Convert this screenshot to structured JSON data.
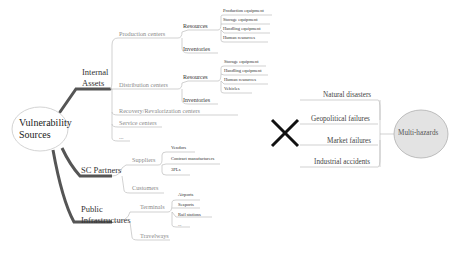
{
  "diagram": {
    "left_map": {
      "root": {
        "line1": "Vulnerability",
        "line2": "Sources"
      },
      "branches": [
        {
          "label_line1": "Internal",
          "label_line2": "Assets",
          "children": [
            {
              "label": "Production centers",
              "children": [
                {
                  "label": "Resources",
                  "children": [
                    "Production equipment",
                    "Storage equipment",
                    "Handling equipment",
                    "Human resources"
                  ]
                },
                {
                  "label": "Inventories",
                  "children": []
                }
              ]
            },
            {
              "label": "Distribution centers",
              "children": [
                {
                  "label": "Resources",
                  "children": [
                    "Storage equipment",
                    "Handling equipment",
                    "Human resources",
                    "Vehicles"
                  ]
                },
                {
                  "label": "Inventories",
                  "children": []
                }
              ]
            },
            {
              "label": "Recovery/Revalorization centers",
              "children": []
            },
            {
              "label": "Service centers",
              "children": []
            },
            {
              "label": "...",
              "children": []
            }
          ]
        },
        {
          "label_line1": "SC Partners",
          "label_line2": "",
          "children": [
            {
              "label": "Suppliers",
              "children": [
                "Vendors",
                "Contract manufacturers",
                "3PLs"
              ]
            },
            {
              "label": "Customers",
              "children": []
            }
          ]
        },
        {
          "label_line1": "Public",
          "label_line2": "Infrastructures",
          "children": [
            {
              "label": "Terminals",
              "children": [
                "Airports",
                "Seaports",
                "Rail stations",
                "..."
              ]
            },
            {
              "label": "Travelways",
              "children": []
            }
          ]
        }
      ]
    },
    "cross_symbol": "✕",
    "right_map": {
      "root": "Multi-hazards",
      "items": [
        "Natural disasters",
        "Geopolitical failures",
        "Market failures",
        "Industrial accidents"
      ]
    },
    "colors": {
      "thick_branch": "#555555",
      "thin_line": "#bdbdbd",
      "hazard_circle_fill": "#e3e3e3",
      "hazard_circle_stroke": "#b0b0b0",
      "cross": "#111111"
    }
  }
}
